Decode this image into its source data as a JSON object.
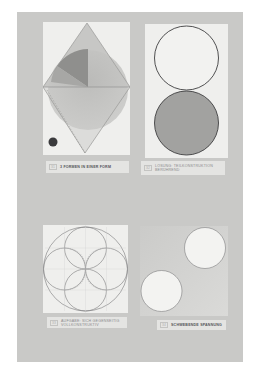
{
  "page": {
    "background": "#c9c9c7",
    "paper_color": "#efefed"
  },
  "plates": [
    {
      "id": "top-left",
      "figure": "diamond-with-circle-and-sector",
      "caption_number": "31",
      "caption_text": "3 Formen in einer Form"
    },
    {
      "id": "top-right",
      "figure": "two-stacked-circles-outline-and-filled",
      "caption_number": "32",
      "caption_text": "Lösung: Teilkonstruktion Berührend"
    },
    {
      "id": "bottom-left",
      "figure": "rosette-of-four-circles-in-circle",
      "caption_number": "33",
      "caption_text": "Aufgabe: Sich gegenseitig vollkonstruktiv"
    },
    {
      "id": "bottom-right",
      "figure": "two-white-circles-on-gray",
      "caption_number": "34",
      "caption_text": "Schwebende Spannung"
    }
  ],
  "margin_marks": [
    "binder-hole-icon",
    "binder-hole-icon"
  ]
}
